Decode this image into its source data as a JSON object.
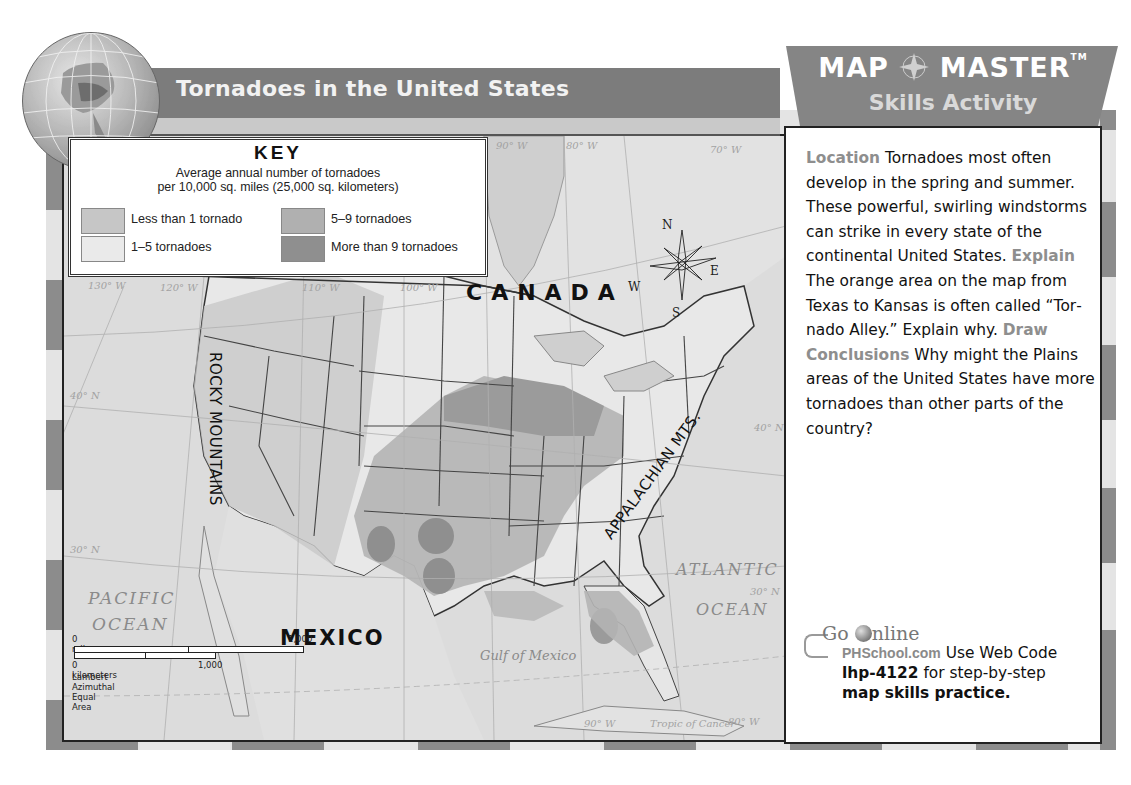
{
  "header": {
    "title": "Tornadoes in the United States",
    "brand_title_left": "MAP",
    "brand_title_right": "MASTER",
    "brand_trademark": "TM",
    "brand_subtitle": "Skills Activity"
  },
  "key": {
    "title": "KEY",
    "subtitle_line1": "Average annual number of tornadoes",
    "subtitle_line2": "per 10,000 sq. miles (25,000 sq. kilometers)",
    "items": [
      {
        "label": "Less than 1 tornado",
        "color": "#c6c6c6"
      },
      {
        "label": "1–5 tornadoes",
        "color": "#e6e6e6"
      },
      {
        "label": "5–9 tornadoes",
        "color": "#b0b0b0"
      },
      {
        "label": "More than 9 tornadoes",
        "color": "#8f8f8f"
      }
    ]
  },
  "map": {
    "labels": {
      "canada": "CANADA",
      "mexico": "MEXICO",
      "pacific_1": "PACIFIC",
      "pacific_2": "OCEAN",
      "atlantic_1": "ATLANTIC",
      "atlantic_2": "OCEAN",
      "gulf": "Gulf of Mexico",
      "rocky": "ROCKY MOUNTAINS",
      "appalachian": "APPALACHIAN MTS.",
      "tropic": "Tropic of Cancer"
    },
    "grid_labels": {
      "lon_130": "130° W",
      "lon_120": "120° W",
      "lon_110": "110° W",
      "lon_100": "100° W",
      "lon_90_top": "90° W",
      "lon_80_top": "80° W",
      "lon_70": "70° W",
      "lon_90_bottom": "90° W",
      "lon_80_bottom": "80° W",
      "lat_40_west": "40° N",
      "lat_40_east": "40° N",
      "lat_30_west": "30° N",
      "lat_30_east": "30° N"
    },
    "compass": {
      "n": "N",
      "s": "S",
      "e": "E",
      "w": "W"
    },
    "scale": {
      "miles_start": "0 miles",
      "miles_end": "1,000",
      "km_start": "0 kilometers",
      "km_end": "1,000",
      "projection": "Lambert Azimuthal Equal Area"
    }
  },
  "side_panel": {
    "q1_keyword": "Location",
    "q1_text": "Tornadoes most often develop in the spring and summer. These power­ful, swirling windstorms can strike in every state of the continental United States.",
    "q2_keyword": "Explain",
    "q2_text": "The orange area on the map from Texas to Kansas is often called “Tor­nado Alley.” Explain why.",
    "q3_keyword": "Draw Conclusions",
    "q3_text": "Why might the Plains areas of the United States have more tor­nadoes than other parts of the country?",
    "go_online": {
      "logo_go": "Go",
      "logo_nline": "nline",
      "site": "PHSchool.com",
      "line1_rest": "Use Web Code",
      "web_code": "lhp-4122",
      "line2_rest": "for step-by-step",
      "line3": "map skills practice."
    }
  },
  "colors": {
    "banner": "#7c7c7c",
    "keyword": "#8e8e8e",
    "stripe_dark": "#8c8c8c",
    "stripe_light": "#e8e8e8"
  }
}
